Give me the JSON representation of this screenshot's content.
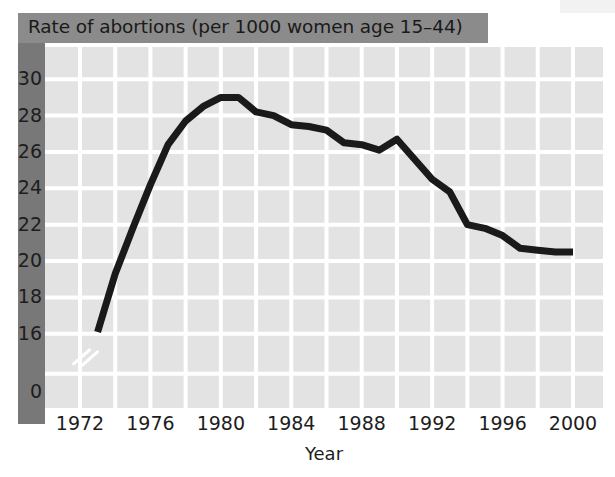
{
  "figure": {
    "title": "Rate of abortions (per 1000 women age 15–44)",
    "title_band_color": "#8b8b8b",
    "spine_color": "#787878",
    "panel_color": "#e3e3e3",
    "gridline_color": "#ffffff",
    "line_color": "#1a1a1a",
    "axis_break_label": "0"
  },
  "chart_data": {
    "type": "line",
    "title": "Rate of abortions (per 1000 women age 15–44)",
    "xlabel": "Year",
    "ylabel": "",
    "xlim": [
      1972,
      2000
    ],
    "ylim": [
      15,
      31
    ],
    "grid": true,
    "legend": "none",
    "y_axis_broken": true,
    "y_break_label": "0",
    "xticks": [
      1972,
      1976,
      1980,
      1984,
      1988,
      1992,
      1996,
      2000
    ],
    "xticklabels": [
      "1972",
      "1976",
      "1980",
      "1984",
      "1988",
      "1992",
      "1996",
      "2000"
    ],
    "yticks": [
      16,
      18,
      20,
      22,
      24,
      26,
      28,
      30
    ],
    "yticklabels": [
      "16",
      "18",
      "20",
      "22",
      "24",
      "26",
      "28",
      "30"
    ],
    "x": [
      1973,
      1974,
      1975,
      1976,
      1977,
      1978,
      1979,
      1980,
      1981,
      1982,
      1983,
      1984,
      1985,
      1986,
      1987,
      1988,
      1989,
      1990,
      1991,
      1992,
      1993,
      1994,
      1995,
      1996,
      1997,
      1998,
      1999,
      2000
    ],
    "values": [
      16.1,
      19.3,
      21.8,
      24.2,
      26.4,
      27.7,
      28.5,
      29.0,
      29.0,
      28.2,
      28.0,
      27.5,
      27.4,
      27.2,
      26.5,
      26.4,
      26.1,
      26.7,
      25.6,
      24.5,
      23.8,
      22.0,
      21.8,
      21.4,
      20.7,
      20.6,
      20.5,
      20.5
    ],
    "series": [
      {
        "name": "Rate of abortions",
        "values": [
          16.1,
          19.3,
          21.8,
          24.2,
          26.4,
          27.7,
          28.5,
          29.0,
          29.0,
          28.2,
          28.0,
          27.5,
          27.4,
          27.2,
          26.5,
          26.4,
          26.1,
          26.7,
          25.6,
          24.5,
          23.8,
          22.0,
          21.8,
          21.4,
          20.7,
          20.6,
          20.5,
          20.5
        ]
      }
    ]
  }
}
